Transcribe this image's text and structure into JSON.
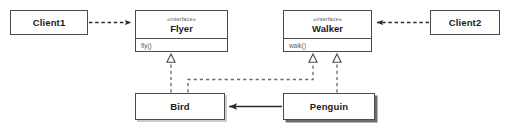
{
  "diagram": {
    "kind": "uml-class-diagram",
    "background": "#ffffff",
    "stroke_color": "#4a4a4a",
    "text_color": "#1b1b1b",
    "muted_text_color": "#5a5a5a",
    "canvas": {
      "width": 512,
      "height": 128
    }
  },
  "nodes": {
    "client1": {
      "name": "Client1",
      "type": "class",
      "x": 10,
      "y": 10,
      "w": 78,
      "h": 25
    },
    "client2": {
      "name": "Client2",
      "type": "class",
      "x": 430,
      "y": 10,
      "w": 70,
      "h": 25
    },
    "flyer": {
      "name": "Flyer",
      "stereotype": "«interface»",
      "type": "interface",
      "operation": "fly()",
      "x": 135,
      "y": 10,
      "w": 93,
      "h": 42
    },
    "walker": {
      "name": "Walker",
      "stereotype": "«interface»",
      "type": "interface",
      "operation": "walk()",
      "x": 283,
      "y": 10,
      "w": 89,
      "h": 42
    },
    "bird": {
      "name": "Bird",
      "type": "class",
      "x": 135,
      "y": 93,
      "w": 90,
      "h": 27
    },
    "penguin": {
      "name": "Penguin",
      "type": "class",
      "x": 283,
      "y": 93,
      "w": 92,
      "h": 27
    }
  },
  "edges": [
    {
      "id": "client1-uses-flyer",
      "from": "client1",
      "to": "flyer",
      "relation": "dependency",
      "line": "dashed",
      "arrowhead": "open-filled"
    },
    {
      "id": "client2-uses-walker",
      "from": "client2",
      "to": "walker",
      "relation": "dependency",
      "line": "dashed",
      "arrowhead": "open-filled"
    },
    {
      "id": "bird-implements-flyer",
      "from": "bird",
      "to": "flyer",
      "relation": "realization",
      "line": "dashed",
      "arrowhead": "hollow-triangle"
    },
    {
      "id": "bird-implements-walker",
      "from": "bird",
      "to": "walker",
      "relation": "realization",
      "line": "dashed",
      "arrowhead": "hollow-triangle"
    },
    {
      "id": "penguin-implements-walker",
      "from": "penguin",
      "to": "walker",
      "relation": "realization",
      "line": "dashed",
      "arrowhead": "hollow-triangle"
    },
    {
      "id": "penguin-extends-bird",
      "from": "penguin",
      "to": "bird",
      "relation": "association",
      "line": "solid",
      "arrowhead": "filled-arrow"
    }
  ]
}
